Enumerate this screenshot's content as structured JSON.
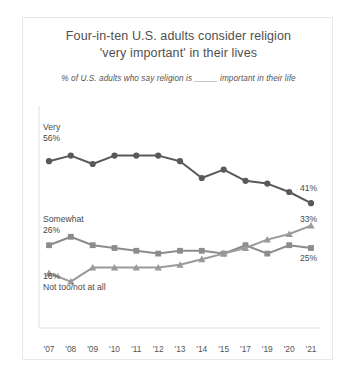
{
  "chart_data": {
    "type": "line",
    "title": "Four-in-ten U.S. adults consider religion 'very important' in their lives",
    "title_line1": "Four-in-ten U.S. adults consider religion",
    "title_line2": "'very important' in their lives",
    "subtitle": "% of U.S. adults who say religion is _____ important in their life",
    "xlabel": "",
    "ylabel": "",
    "ylim": [
      0,
      65
    ],
    "grid": false,
    "legend_position": "inline-endpoints",
    "categories": [
      "'07",
      "'08",
      "'09",
      "'10",
      "'11",
      "'12",
      "'13",
      "'14",
      "'15",
      "'17",
      "'19",
      "'20",
      "'21"
    ],
    "series": [
      {
        "name": "Very",
        "marker": "circle",
        "color": "#595959",
        "start_label": "56%",
        "end_label": "41%",
        "values": [
          56,
          58,
          55,
          58,
          58,
          58,
          56,
          50,
          53,
          49,
          48,
          45,
          41
        ]
      },
      {
        "name": "Somewhat",
        "marker": "square",
        "color": "#8c8c8c",
        "start_label": "26%",
        "end_label": "25%",
        "values": [
          26,
          29,
          26,
          25,
          24,
          23,
          24,
          24,
          23,
          26,
          23,
          26,
          25
        ]
      },
      {
        "name": "Not too/not at all",
        "marker": "triangle",
        "color": "#9a9a9a",
        "start_label": "16%",
        "end_label": "33%",
        "values": [
          16,
          13,
          18,
          18,
          18,
          18,
          19,
          21,
          23,
          25,
          28,
          30,
          33
        ]
      }
    ],
    "annotations": [
      {
        "text": "Very",
        "series": "Very",
        "position": "left-top"
      },
      {
        "text": "56%",
        "series": "Very",
        "position": "left-top"
      },
      {
        "text": "41%",
        "series": "Very",
        "position": "right-end"
      },
      {
        "text": "Somewhat",
        "series": "Somewhat",
        "position": "left-top"
      },
      {
        "text": "26%",
        "series": "Somewhat",
        "position": "left-top"
      },
      {
        "text": "25%",
        "series": "Somewhat",
        "position": "right-end"
      },
      {
        "text": "16%",
        "series": "Not too/not at all",
        "position": "left-bottom"
      },
      {
        "text": "Not too/not at all",
        "series": "Not too/not at all",
        "position": "left-bottom"
      },
      {
        "text": "33%",
        "series": "Not too/not at all",
        "position": "right-end"
      }
    ]
  },
  "labels": {
    "very_name": "Very",
    "very_start": "56%",
    "very_end": "41%",
    "somewhat_name": "Somewhat",
    "somewhat_start": "26%",
    "somewhat_end": "25%",
    "nottoo_start": "16%",
    "nottoo_name": "Not too/not at all",
    "nottoo_end": "33%"
  },
  "colors": {
    "very": "#595959",
    "somewhat": "#8c8c8c",
    "nottoo": "#9a9a9a",
    "axis": "#dcdcdc",
    "text": "#4a4a4a",
    "border": "#e8e8e8"
  }
}
